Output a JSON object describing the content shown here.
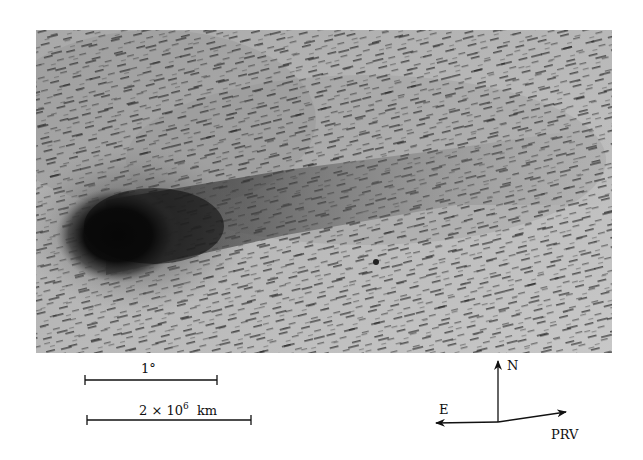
{
  "figure": {
    "type": "astronomical-photograph",
    "colors": {
      "background": "#ffffff",
      "sky": "#b4b4b4",
      "coma": "#0a0a0a",
      "star_trails": "#2a2a2a",
      "ink": "#111111"
    }
  },
  "scale_bars": [
    {
      "label": "1°"
    },
    {
      "label_base": "2 × 10",
      "label_exponent": "6",
      "label_unit": "km"
    }
  ],
  "compass": {
    "north_label": "N",
    "east_label": "E",
    "velocity_label": "PRV"
  }
}
